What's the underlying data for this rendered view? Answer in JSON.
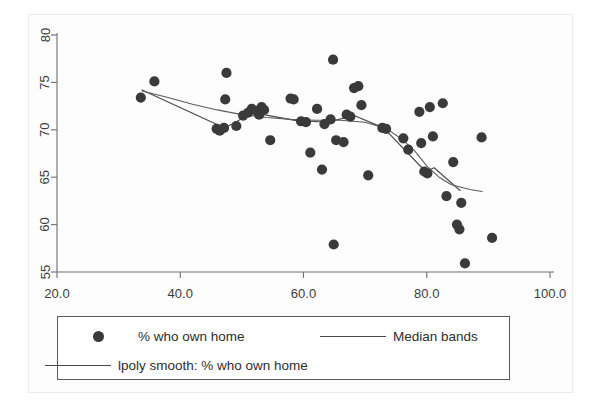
{
  "chart_data": {
    "type": "scatter",
    "title": "",
    "xlabel": "",
    "ylabel": "",
    "xlim": [
      20.0,
      100.0
    ],
    "ylim": [
      55,
      80
    ],
    "grid": false,
    "legend_position": "bottom",
    "x_ticks": [
      "20.0",
      "40.0",
      "60.0",
      "80.0",
      "100.0"
    ],
    "x_tick_values": [
      20,
      40,
      60,
      80,
      100
    ],
    "y_ticks": [
      "55",
      "60",
      "65",
      "70",
      "75",
      "80"
    ],
    "y_tick_values": [
      55,
      60,
      65,
      70,
      75,
      80
    ],
    "series": [
      {
        "name": "% who own home",
        "type": "scatter",
        "marker": "filled-circle",
        "color": "#3a3a3a",
        "points": [
          [
            33.6,
            73.4
          ],
          [
            35.8,
            75.1
          ],
          [
            45.9,
            70.1
          ],
          [
            46.4,
            69.9
          ],
          [
            47.1,
            70.2
          ],
          [
            47.3,
            73.2
          ],
          [
            47.5,
            76.0
          ],
          [
            49.1,
            70.4
          ],
          [
            50.2,
            71.5
          ],
          [
            51.0,
            71.8
          ],
          [
            51.6,
            72.2
          ],
          [
            52.4,
            72.0
          ],
          [
            52.8,
            71.6
          ],
          [
            53.2,
            72.4
          ],
          [
            53.6,
            72.1
          ],
          [
            54.6,
            68.9
          ],
          [
            57.9,
            73.3
          ],
          [
            58.4,
            73.2
          ],
          [
            59.6,
            70.9
          ],
          [
            60.4,
            70.8
          ],
          [
            61.1,
            67.6
          ],
          [
            62.2,
            72.2
          ],
          [
            63.0,
            65.8
          ],
          [
            63.4,
            70.6
          ],
          [
            64.4,
            71.1
          ],
          [
            64.8,
            77.4
          ],
          [
            64.9,
            57.9
          ],
          [
            65.3,
            68.9
          ],
          [
            66.5,
            68.7
          ],
          [
            67.0,
            71.6
          ],
          [
            67.6,
            71.4
          ],
          [
            68.2,
            74.4
          ],
          [
            68.9,
            74.6
          ],
          [
            69.4,
            72.6
          ],
          [
            70.5,
            65.2
          ],
          [
            72.8,
            70.2
          ],
          [
            73.4,
            70.1
          ],
          [
            76.2,
            69.1
          ],
          [
            77.0,
            67.9
          ],
          [
            78.8,
            71.9
          ],
          [
            79.1,
            68.6
          ],
          [
            79.6,
            65.6
          ],
          [
            80.1,
            65.4
          ],
          [
            80.5,
            72.4
          ],
          [
            81.0,
            69.3
          ],
          [
            82.6,
            72.8
          ],
          [
            83.2,
            63.0
          ],
          [
            84.3,
            66.6
          ],
          [
            84.9,
            60.0
          ],
          [
            85.3,
            59.5
          ],
          [
            85.6,
            62.3
          ],
          [
            86.2,
            55.9
          ],
          [
            88.9,
            69.2
          ],
          [
            90.6,
            58.6
          ]
        ]
      },
      {
        "name": "Median bands",
        "type": "line",
        "color": "#4a4a4a",
        "points": [
          [
            33.8,
            74.2
          ],
          [
            47.2,
            70.2
          ],
          [
            51.8,
            71.8
          ],
          [
            58.6,
            71.0
          ],
          [
            63.8,
            70.8
          ],
          [
            68.2,
            71.5
          ],
          [
            73.0,
            70.2
          ],
          [
            79.8,
            65.6
          ],
          [
            81.2,
            66.0
          ],
          [
            85.4,
            63.6
          ]
        ]
      },
      {
        "name": "lpoly smooth: % who own home",
        "type": "line",
        "color": "#5a5a5a",
        "points": [
          [
            33.8,
            74.1
          ],
          [
            38.0,
            73.4
          ],
          [
            42.0,
            72.7
          ],
          [
            46.0,
            72.1
          ],
          [
            50.0,
            71.6
          ],
          [
            54.0,
            71.3
          ],
          [
            58.0,
            71.1
          ],
          [
            62.0,
            71.0
          ],
          [
            66.0,
            71.0
          ],
          [
            70.0,
            70.8
          ],
          [
            73.5,
            70.1
          ],
          [
            76.0,
            69.0
          ],
          [
            78.0,
            67.8
          ],
          [
            80.0,
            66.2
          ],
          [
            82.0,
            65.0
          ],
          [
            84.0,
            64.2
          ],
          [
            87.0,
            63.7
          ],
          [
            89.0,
            63.5
          ]
        ]
      }
    ]
  },
  "legend": {
    "entries": [
      {
        "key": "marker",
        "label": "% who own home"
      },
      {
        "key": "line",
        "label": "Median bands"
      },
      {
        "key": "line",
        "label": "lpoly smooth: % who own home"
      }
    ]
  }
}
